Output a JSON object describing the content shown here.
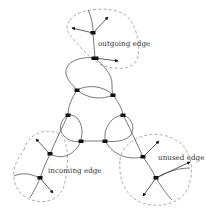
{
  "diagram": {
    "title": "",
    "labels": {
      "outgoing": "outgoing edge",
      "incoming": "incoming edge",
      "unused": "unused edge"
    },
    "colors": {
      "curve": "#555555",
      "dashed_boundary": "#8a8a8a",
      "node": "#111111",
      "text": "#333333"
    },
    "regions": [
      {
        "name": "top-region",
        "label_key": "outgoing"
      },
      {
        "name": "bottom-left-region",
        "label_key": "incoming"
      },
      {
        "name": "bottom-right-region",
        "label_key": "unused"
      }
    ]
  }
}
